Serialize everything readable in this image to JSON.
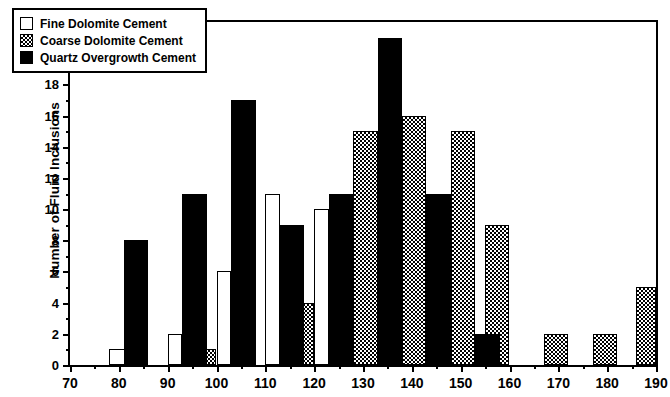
{
  "chart_data": {
    "type": "bar",
    "title": "",
    "xlabel": "",
    "ylabel": "Number of Fluid Inclusions",
    "xlim": [
      70,
      190
    ],
    "ylim": [
      0,
      22
    ],
    "ytick_step": 2,
    "xtick_step": 10,
    "x_minor_step": 5,
    "grid": false,
    "legend_position": "top-left",
    "yticks": [
      0,
      2,
      4,
      6,
      8,
      10,
      12,
      14,
      16,
      18,
      20,
      22
    ],
    "xticks": [
      70,
      80,
      90,
      100,
      110,
      120,
      130,
      140,
      150,
      160,
      170,
      180,
      190
    ],
    "x_minor_ticks": [
      75,
      85,
      95,
      105,
      115,
      125,
      135,
      145,
      155,
      165,
      175,
      185
    ],
    "y_minor_ticks": [
      1,
      3,
      5,
      7,
      9,
      11,
      13,
      15,
      17,
      19,
      21
    ],
    "series": [
      {
        "name": "Fine Dolomite Cement",
        "style": "white-outline",
        "color": "#ffffff",
        "bars": [
          {
            "x0": 78,
            "x1": 82,
            "value": 1
          },
          {
            "x0": 90,
            "x1": 93,
            "value": 2
          },
          {
            "x0": 100,
            "x1": 103,
            "value": 6
          },
          {
            "x0": 110,
            "x1": 113,
            "value": 11
          },
          {
            "x0": 120,
            "x1": 123,
            "value": 10
          },
          {
            "x0": 130,
            "x1": 133,
            "value": 4
          },
          {
            "x0": 140,
            "x1": 143,
            "value": 3
          },
          {
            "x0": 150,
            "x1": 153,
            "value": 2
          }
        ]
      },
      {
        "name": "Coarse Dolomite Cement",
        "style": "checker-gray",
        "color": "#808080",
        "bars": [
          {
            "x0": 96,
            "x1": 100,
            "value": 1
          },
          {
            "x0": 117,
            "x1": 120,
            "value": 4
          },
          {
            "x0": 128,
            "x1": 133,
            "value": 15
          },
          {
            "x0": 138,
            "x1": 143,
            "value": 16
          },
          {
            "x0": 148,
            "x1": 153,
            "value": 15
          },
          {
            "x0": 155,
            "x1": 160,
            "value": 9
          },
          {
            "x0": 167,
            "x1": 172,
            "value": 2
          },
          {
            "x0": 177,
            "x1": 182,
            "value": 2
          },
          {
            "x0": 186,
            "x1": 190,
            "value": 5
          }
        ]
      },
      {
        "name": "Quartz Overgrowth Cement",
        "style": "solid-black",
        "color": "#000000",
        "bars": [
          {
            "x0": 81,
            "x1": 86,
            "value": 8
          },
          {
            "x0": 93,
            "x1": 98,
            "value": 11
          },
          {
            "x0": 103,
            "x1": 108,
            "value": 17
          },
          {
            "x0": 113,
            "x1": 118,
            "value": 9
          },
          {
            "x0": 123,
            "x1": 128,
            "value": 11
          },
          {
            "x0": 133,
            "x1": 138,
            "value": 21
          },
          {
            "x0": 143,
            "x1": 148,
            "value": 11
          },
          {
            "x0": 153,
            "x1": 158,
            "value": 2
          }
        ]
      }
    ]
  },
  "legend": {
    "items": [
      {
        "label": "Fine Dolomite Cement",
        "swatch": "fine"
      },
      {
        "label": "Coarse Dolomite Cement",
        "swatch": "coarse"
      },
      {
        "label": "Quartz Overgrowth Cement",
        "swatch": "quartz"
      }
    ]
  }
}
